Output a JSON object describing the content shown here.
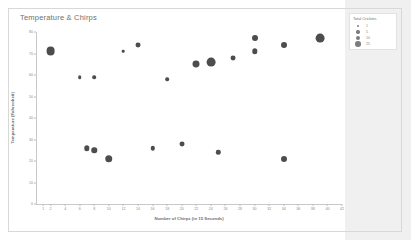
{
  "chart_data": {
    "type": "scatter",
    "title": "Temperature & Chirps",
    "xlabel": "Number of Chirps (in 15 Seconds)",
    "ylabel": "Temperature (Fahrenheit)",
    "xlim": [
      0,
      42
    ],
    "ylim": [
      0,
      80
    ],
    "xticks": [
      1,
      2,
      4,
      6,
      8,
      10,
      12,
      14,
      16,
      18,
      20,
      22,
      24,
      26,
      28,
      30,
      32,
      34,
      36,
      38,
      40,
      42
    ],
    "yticks": [
      0,
      10,
      20,
      30,
      40,
      50,
      60,
      70,
      80
    ],
    "grid": false,
    "legend": {
      "title": "Total Crickets",
      "position": "top-right",
      "entries": [
        {
          "label": "1",
          "size": 2.2
        },
        {
          "label": "5",
          "size": 3.4
        },
        {
          "label": "10",
          "size": 4.4
        },
        {
          "label": "25",
          "size": 5.6
        }
      ]
    },
    "marker_color": "#4d4d4d",
    "size_field": "Total Crickets",
    "points": [
      {
        "x": 2,
        "y": 71,
        "size": 25
      },
      {
        "x": 6,
        "y": 59,
        "size": 5
      },
      {
        "x": 8,
        "y": 59,
        "size": 5
      },
      {
        "x": 12,
        "y": 71,
        "size": 1
      },
      {
        "x": 14,
        "y": 74,
        "size": 10
      },
      {
        "x": 18,
        "y": 58,
        "size": 5
      },
      {
        "x": 22,
        "y": 65,
        "size": 18
      },
      {
        "x": 24,
        "y": 66,
        "size": 25
      },
      {
        "x": 27,
        "y": 68,
        "size": 10
      },
      {
        "x": 30,
        "y": 77,
        "size": 14
      },
      {
        "x": 30,
        "y": 71,
        "size": 12
      },
      {
        "x": 34,
        "y": 74,
        "size": 14
      },
      {
        "x": 39,
        "y": 77,
        "size": 25
      },
      {
        "x": 7,
        "y": 26,
        "size": 12
      },
      {
        "x": 8,
        "y": 25,
        "size": 12
      },
      {
        "x": 10,
        "y": 21,
        "size": 20
      },
      {
        "x": 16,
        "y": 26,
        "size": 8
      },
      {
        "x": 20,
        "y": 28,
        "size": 10
      },
      {
        "x": 25,
        "y": 24,
        "size": 8
      },
      {
        "x": 34,
        "y": 21,
        "size": 14
      }
    ]
  }
}
